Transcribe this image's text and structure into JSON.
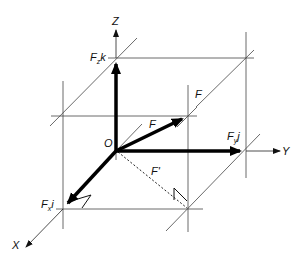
{
  "diagram": {
    "origin_label": "O",
    "axes": {
      "x": "X",
      "y": "Y",
      "z": "Z"
    },
    "vectors": {
      "F": "F",
      "F_top": "F",
      "F_prime": "F'",
      "Fx_base": "F",
      "Fx_sub": "x",
      "Fx_unit": "i",
      "Fy_base": "F",
      "Fy_sub": "y",
      "Fy_unit": "j",
      "Fz_base": "F",
      "Fz_sub": "z",
      "Fz_unit": "k"
    },
    "colors": {
      "line": "#000000",
      "construction": "#444444",
      "background": "#ffffff"
    }
  }
}
